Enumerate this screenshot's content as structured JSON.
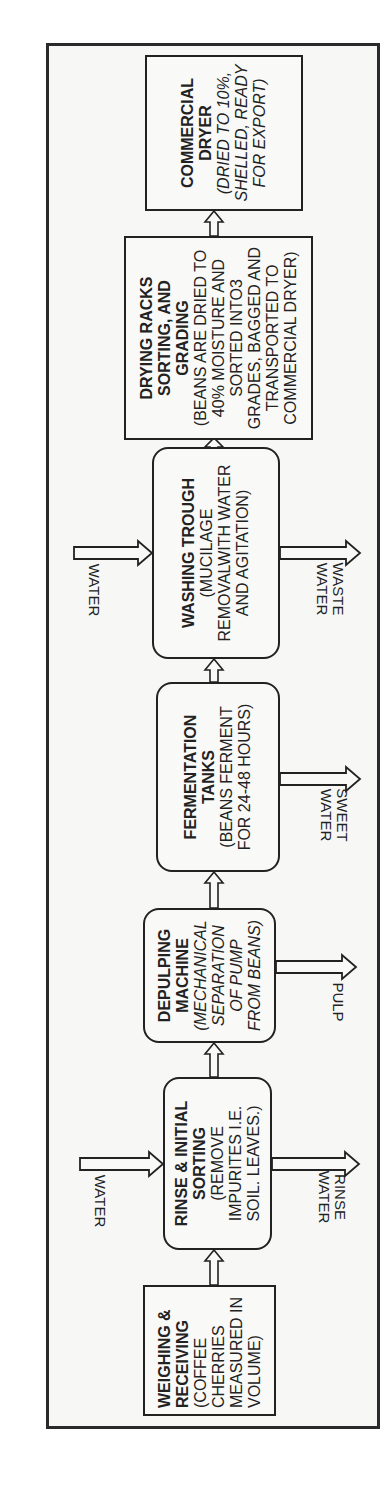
{
  "diagram": {
    "title": "",
    "orientation": "rotated -90deg (flow reads bottom to top)",
    "steps": [
      {
        "id": "weighing",
        "title": "WEIGHING & RECEIVING",
        "desc": "(COFFEE CHERRIES MEASURED IN VOLUME)",
        "shape": "rectangle",
        "italic": false
      },
      {
        "id": "rinse",
        "title": "RINSE & INITIAL SORTING",
        "desc": "(REMOVE IMPURITES I.E. SOIL. LEAVES.)",
        "shape": "rounded",
        "italic": false
      },
      {
        "id": "depulping",
        "title": "DEPULPING MACHINE",
        "desc": "(MECHANICAL SEPARATION OF PUMP FROM BEANS)",
        "shape": "rounded",
        "italic": true
      },
      {
        "id": "fermentation",
        "title": "FERMENTATION TANKS",
        "desc": "(BEANS FERMENT FOR 24-48 HOURS)",
        "shape": "rounded",
        "italic": false
      },
      {
        "id": "washing",
        "title": "WASHING TROUGH",
        "desc": "(MUCILAGE REMOVALWITH WATER AND AGITATION)",
        "shape": "rounded",
        "italic": false
      },
      {
        "id": "drying",
        "title": "DRYING RACKS SORTING, AND GRADING",
        "desc": "(BEANS ARE DRIED TO 40% MOISTURE AND SORTED INTO3 GRADES, BAGGED AND TRANSPORTED TO COMMERCIAL DRYER)",
        "shape": "rectangle",
        "italic": false
      },
      {
        "id": "commercial",
        "title": "COMMERCIAL DRYER",
        "desc": "(DRIED TO 10%, SHELLED, READY FOR EXPORT)",
        "shape": "rectangle",
        "italic": true
      }
    ],
    "inputs": [
      {
        "to": "rinse",
        "label": "WATER"
      },
      {
        "to": "washing",
        "label": "WATER"
      }
    ],
    "outputs": [
      {
        "from": "rinse",
        "label": "RINSE WATER"
      },
      {
        "from": "depulping",
        "label": "PULP"
      },
      {
        "from": "fermentation",
        "label": "SWEET WATER"
      },
      {
        "from": "washing",
        "label": "WASTE WATER"
      }
    ],
    "colors": {
      "stroke": "#222222",
      "frame": "#2a2a2a",
      "background": "#f7f7f6"
    }
  }
}
